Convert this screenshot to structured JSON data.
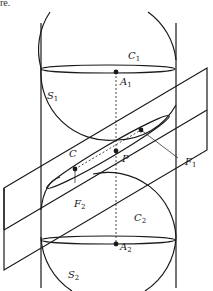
{
  "caption_fragment": "re.",
  "labels": {
    "C1": {
      "base": "C",
      "sub": "1"
    },
    "A1": {
      "base": "A",
      "sub": "1"
    },
    "S1": {
      "base": "S",
      "sub": "1"
    },
    "C": {
      "base": "C",
      "sub": ""
    },
    "P": {
      "base": "P",
      "sub": ""
    },
    "F1": {
      "base": "F",
      "sub": "1"
    },
    "F2": {
      "base": "F",
      "sub": "2"
    },
    "C2": {
      "base": "C",
      "sub": "2"
    },
    "A2": {
      "base": "A",
      "sub": "2"
    },
    "S2": {
      "base": "S",
      "sub": "2"
    }
  },
  "colors": {
    "stroke": "#1a1a1a",
    "background": "#ffffff"
  }
}
